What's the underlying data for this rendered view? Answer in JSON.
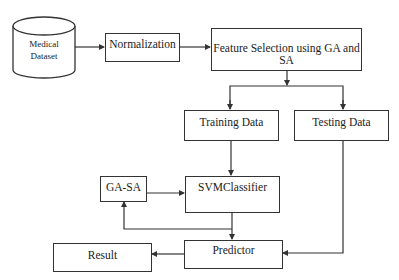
{
  "diagram": {
    "nodes": {
      "dataset": {
        "line1": "Medical",
        "line2": "Dataset",
        "shape": "cylinder"
      },
      "normalization": {
        "label": "Normalization"
      },
      "feature_selection": {
        "label": "Feature Selection using GA and SA"
      },
      "training": {
        "label": "Training Data"
      },
      "testing": {
        "label": "Testing Data"
      },
      "gasa": {
        "label": "GA-SA"
      },
      "svm": {
        "label": "SVMClassifier"
      },
      "predictor": {
        "label": "Predictor"
      },
      "result": {
        "label": "Result"
      }
    },
    "edges": [
      {
        "from": "Medical Dataset",
        "to": "Normalization"
      },
      {
        "from": "Normalization",
        "to": "Feature Selection using GA and SA"
      },
      {
        "from": "Feature Selection using GA and SA",
        "to": "Training Data"
      },
      {
        "from": "Feature Selection using GA and SA",
        "to": "Testing Data"
      },
      {
        "from": "Training Data",
        "to": "SVMClassifier"
      },
      {
        "from": "GA-SA",
        "to": "SVMClassifier"
      },
      {
        "from": "SVMClassifier",
        "to": "Predictor"
      },
      {
        "from": "SVMClassifier",
        "to": "GA-SA"
      },
      {
        "from": "Testing Data",
        "to": "Predictor"
      },
      {
        "from": "Predictor",
        "to": "Result"
      }
    ],
    "colors": {
      "stroke": "#333333",
      "background": "#ffffff"
    }
  }
}
